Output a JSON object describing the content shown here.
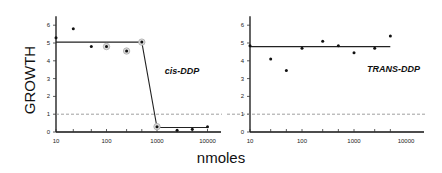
{
  "chart_data": [
    {
      "type": "scatter",
      "title": "",
      "series_label": "cis-DDP",
      "xlabel": "nmoles",
      "ylabel": "GROWTH",
      "xscale": "log",
      "xlim": [
        10,
        15000
      ],
      "ylim": [
        0,
        6.5
      ],
      "xticks": [
        10,
        100,
        1000,
        10000
      ],
      "xtick_labels": [
        "10",
        "100",
        "1000",
        "10000"
      ],
      "yticks": [
        0,
        1,
        2,
        3,
        4,
        5,
        6
      ],
      "ytick_labels": [
        "0",
        "1",
        "2",
        "3",
        "4",
        "5",
        "6"
      ],
      "reference_line": {
        "y": 1,
        "style": "dashed"
      },
      "points": [
        {
          "x": 10,
          "y": 5.3,
          "marker": "dot"
        },
        {
          "x": 22,
          "y": 5.8,
          "marker": "dot"
        },
        {
          "x": 50,
          "y": 4.8,
          "marker": "dot"
        },
        {
          "x": 100,
          "y": 4.8,
          "marker": "circled"
        },
        {
          "x": 250,
          "y": 4.55,
          "marker": "circled"
        },
        {
          "x": 500,
          "y": 5.05,
          "marker": "circled"
        },
        {
          "x": 1000,
          "y": 0.3,
          "marker": "circled"
        },
        {
          "x": 2500,
          "y": 0.1,
          "marker": "dot"
        },
        {
          "x": 5000,
          "y": 0.15,
          "marker": "dot"
        },
        {
          "x": 10000,
          "y": 0.3,
          "marker": "dot"
        }
      ],
      "fit_line": [
        [
          10,
          5.05
        ],
        [
          500,
          5.05
        ],
        [
          1000,
          0.25
        ],
        [
          10000,
          0.25
        ]
      ],
      "grid": false,
      "legend": "none"
    },
    {
      "type": "scatter",
      "title": "",
      "series_label": "TRANS-DDP",
      "xlabel": "nmoles",
      "ylabel": "",
      "xscale": "log",
      "xlim": [
        10,
        15000
      ],
      "ylim": [
        0,
        6.5
      ],
      "xticks": [
        10,
        100,
        1000,
        10000
      ],
      "xtick_labels": [
        "10",
        "100",
        "1000",
        "10000"
      ],
      "yticks": [
        0,
        1,
        2,
        3,
        4,
        5,
        6
      ],
      "ytick_labels": [
        "0",
        "1",
        "2",
        "3",
        "4",
        "5",
        "6"
      ],
      "reference_line": {
        "y": 1,
        "style": "dashed"
      },
      "points": [
        {
          "x": 10,
          "y": 4.85,
          "marker": "dot"
        },
        {
          "x": 25,
          "y": 4.1,
          "marker": "dot"
        },
        {
          "x": 50,
          "y": 3.45,
          "marker": "dot"
        },
        {
          "x": 100,
          "y": 4.7,
          "marker": "dot"
        },
        {
          "x": 250,
          "y": 5.1,
          "marker": "dot"
        },
        {
          "x": 500,
          "y": 4.85,
          "marker": "dot"
        },
        {
          "x": 1000,
          "y": 4.45,
          "marker": "dot"
        },
        {
          "x": 2500,
          "y": 4.7,
          "marker": "dot"
        },
        {
          "x": 5000,
          "y": 5.4,
          "marker": "dot"
        }
      ],
      "fit_line": [
        [
          10,
          4.8
        ],
        [
          5000,
          4.8
        ]
      ],
      "grid": false,
      "legend": "none"
    }
  ],
  "labels": {
    "y_axis_title": "GROWTH",
    "x_axis_title": "nmoles",
    "left_series": "cis-DDP",
    "right_series": "TRANS-DDP"
  }
}
